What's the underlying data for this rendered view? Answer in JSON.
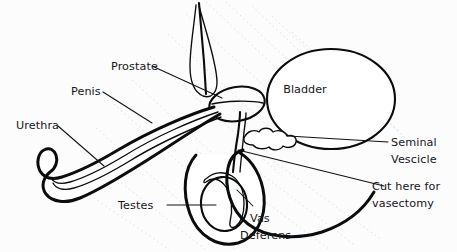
{
  "figure": {
    "background_color": "#fcfcfc",
    "ink_color": "#0b0c0e",
    "width": 457,
    "height": 252
  },
  "labels": {
    "prostate": "Prostate",
    "penis": "Penis",
    "urethra": "Urethra",
    "testes": "Testes",
    "vas_deferens_line1": "Vas",
    "vas_deferens_line2": "Deferens",
    "bladder": "Bladder",
    "seminal_vesicle_line1": "Seminal",
    "seminal_vesicle_line2": "Vescicle",
    "cut_here_line1": "Cut here for",
    "cut_here_line2": "vasectomy"
  },
  "structures": [
    {
      "name": "pubic-tissue-tuft",
      "label": null,
      "style": "stippled"
    },
    {
      "name": "prostate-gland",
      "label": "Prostate",
      "style": "cross-hatched"
    },
    {
      "name": "bladder",
      "label": "Bladder",
      "style": "outline"
    },
    {
      "name": "seminal-vesicle",
      "label": "Seminal Vescicle",
      "style": "lobed-outline"
    },
    {
      "name": "penis-shaft",
      "label": "Penis",
      "style": "outline"
    },
    {
      "name": "urethra-channel",
      "label": "Urethra",
      "style": "inner-channel"
    },
    {
      "name": "scrotum-sac",
      "label": null,
      "style": "outline"
    },
    {
      "name": "testis",
      "label": "Testes",
      "style": "outline"
    },
    {
      "name": "epididymis",
      "label": null,
      "style": "stippled"
    },
    {
      "name": "vas-deferens-duct",
      "label": "Vas Deferens",
      "style": "duct-loop"
    },
    {
      "name": "vasectomy-cut-site",
      "label": "Cut here for vasectomy",
      "style": "leader-target"
    }
  ]
}
